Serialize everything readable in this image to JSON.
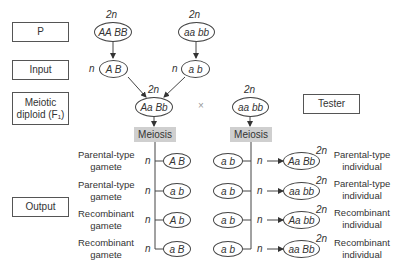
{
  "rows": {
    "p": "P",
    "input": "Input",
    "meiotic_diploid_line1": "Meiotic",
    "meiotic_diploid_line2": "diploid (F₁)",
    "tester": "Tester",
    "output": "Output"
  },
  "ploidy": {
    "diploid": "2n",
    "haploid": "n"
  },
  "parents": {
    "left": "AA BB",
    "right": "aa bb"
  },
  "inputs": {
    "left": "A B",
    "right": "a b"
  },
  "f1": "Aa Bb",
  "cross_symbol": "×",
  "tester_genotype": "aa bb",
  "meiosis_label": "Meiosis",
  "gametes": [
    {
      "label_line1": "Parental-type",
      "label_line2": "gamete",
      "genotype": "A B"
    },
    {
      "label_line1": "Parental-type",
      "label_line2": "gamete",
      "genotype": "a b"
    },
    {
      "label_line1": "Recombinant",
      "label_line2": "gamete",
      "genotype": "A b"
    },
    {
      "label_line1": "Recombinant",
      "label_line2": "gamete",
      "genotype": "a B"
    }
  ],
  "tester_gametes": [
    {
      "genotype": "a b"
    },
    {
      "genotype": "a b"
    },
    {
      "genotype": "a b"
    },
    {
      "genotype": "a b"
    }
  ],
  "progeny": [
    {
      "genotype": "Aa Bb",
      "label_line1": "Parental-type",
      "label_line2": "individual"
    },
    {
      "genotype": "aa bb",
      "label_line1": "Parental-type",
      "label_line2": "individual"
    },
    {
      "genotype": "Aa bb",
      "label_line1": "Recombinant",
      "label_line2": "individual"
    },
    {
      "genotype": "aa Bb",
      "label_line1": "Recombinant",
      "label_line2": "individual"
    }
  ]
}
